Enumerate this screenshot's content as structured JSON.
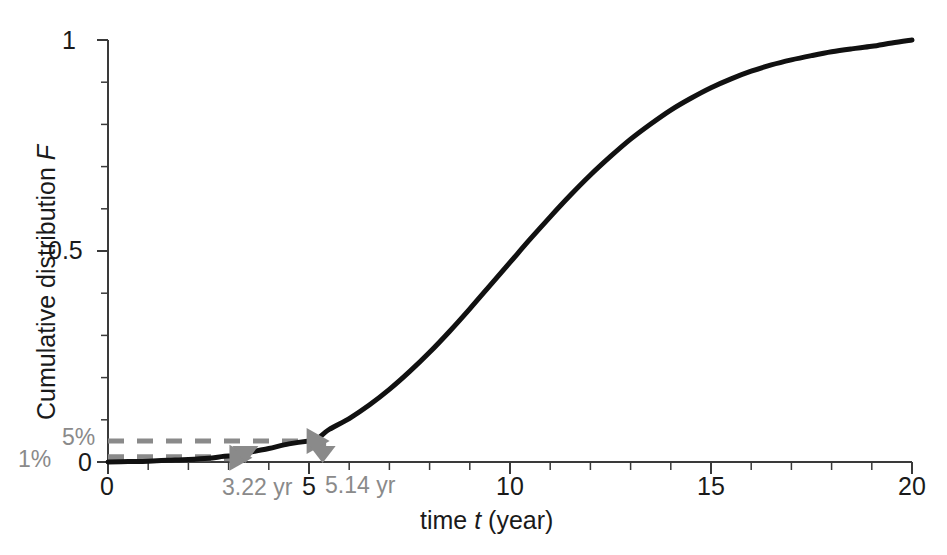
{
  "chart_data": {
    "type": "line",
    "title": "",
    "xlabel": "time t (year)",
    "ylabel": "Cumulative distribution F",
    "xlim": [
      0,
      20
    ],
    "ylim": [
      0,
      1
    ],
    "grid": false,
    "legend": "none",
    "xtick_labels": [
      "0",
      "5",
      "10",
      "15",
      "20"
    ],
    "xtick_values": [
      0,
      5,
      10,
      15,
      20
    ],
    "xtick_minor_step": 1,
    "ytick_labels": [
      "0",
      "0.5",
      "1"
    ],
    "ytick_values": [
      0,
      0.5,
      1
    ],
    "ytick_minor_step": 0.1,
    "series": [
      {
        "name": "Cumulative distribution F",
        "color": "#111111",
        "x": [
          0,
          0.5,
          1,
          1.5,
          2,
          2.5,
          3,
          3.22,
          3.5,
          4,
          4.5,
          5,
          5.14,
          5.5,
          6,
          6.5,
          7,
          7.5,
          8,
          8.5,
          9,
          9.5,
          10,
          10.5,
          11,
          11.5,
          12,
          12.5,
          13,
          13.5,
          14,
          14.5,
          15,
          15.5,
          16,
          16.5,
          17,
          17.5,
          18,
          18.5,
          19,
          19.5,
          20
        ],
        "y": [
          0.0,
          0.001,
          0.002,
          0.004,
          0.006,
          0.009,
          0.014,
          0.01,
          0.022,
          0.032,
          0.043,
          0.05,
          0.05,
          0.077,
          0.103,
          0.135,
          0.172,
          0.214,
          0.26,
          0.31,
          0.363,
          0.418,
          0.473,
          0.528,
          0.581,
          0.632,
          0.68,
          0.724,
          0.765,
          0.801,
          0.834,
          0.862,
          0.887,
          0.908,
          0.926,
          0.941,
          0.953,
          0.963,
          0.972,
          0.979,
          0.985,
          0.993,
          1.0
        ]
      }
    ],
    "annotations": [
      {
        "id": "five-percent",
        "level_label": "5%",
        "level_value": 0.05,
        "time_label": "5.14 yr",
        "time_value": 5.14,
        "color": "#8a8a8a"
      },
      {
        "id": "one-percent",
        "level_label": "1%",
        "level_value": 0.01,
        "time_label": "3.22 yr",
        "time_value": 3.22,
        "color": "#8a8a8a"
      }
    ]
  },
  "axes": {
    "x_title_prefix": "time ",
    "x_title_var": "t",
    "x_title_suffix": " (year)",
    "y_title_prefix": "Cumulative distribution ",
    "y_title_var": "F"
  },
  "labels": {
    "x0": "0",
    "x5": "5",
    "x10": "10",
    "x15": "15",
    "x20": "20",
    "y0": "0",
    "y05": "0.5",
    "y1": "1",
    "pct5": "5%",
    "pct1": "1%",
    "t514": "5.14 yr",
    "t322": "3.22 yr"
  },
  "colors": {
    "curve": "#111111",
    "axis": "#3a3a3a",
    "annotation": "#8a8a8a",
    "annotation_dark": "#6f6f6f",
    "text": "#1a1a1a",
    "background": "#ffffff"
  }
}
